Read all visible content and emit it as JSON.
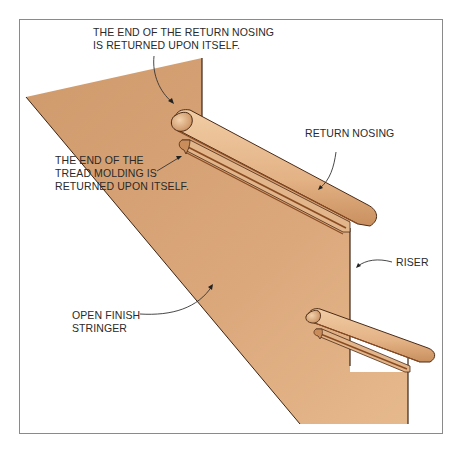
{
  "figure": {
    "type": "illustration",
    "colors": {
      "wood_fill": "#d9a77a",
      "wood_light": "#ecc096",
      "wood_shadow": "#b9794a",
      "outline": "#4a2a16",
      "leader_line": "#333333",
      "frame_border": "#8a8a8a"
    }
  },
  "labels": {
    "return_end": {
      "line1": "THE END OF THE RETURN NOSING",
      "line2": "IS RETURNED UPON ITSELF."
    },
    "tread_molding_end": {
      "line1": "THE END OF THE",
      "line2": "TREAD MOLDING IS",
      "line3": "RETURNED UPON ITSELF."
    },
    "return_nosing": "RETURN NOSING",
    "riser": "RISER",
    "stringer": {
      "line1": "OPEN FINISH",
      "line2": "STRINGER"
    }
  }
}
